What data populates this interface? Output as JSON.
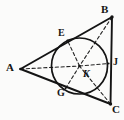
{
  "figure": {
    "kind": "geometry-diagram",
    "canvas": {
      "width": 124,
      "height": 120
    },
    "colors": {
      "background": "#fbfbfa",
      "stroke": "#141414",
      "dash": "#242424",
      "label": "#141414"
    },
    "stroke_widths": {
      "triangle": 1.9,
      "circle": 1.7,
      "dashed": 1.1
    },
    "points": [
      {
        "id": "A",
        "label": "A",
        "x": 20.5,
        "y": 69.0,
        "role": "triangle-vertex",
        "label_x": 6,
        "label_y": 62
      },
      {
        "id": "B",
        "label": "B",
        "x": 112.0,
        "y": 17.0,
        "role": "triangle-vertex",
        "label_x": 101,
        "label_y": 4
      },
      {
        "id": "C",
        "label": "C",
        "x": 110.5,
        "y": 104.0,
        "role": "triangle-vertex",
        "label_x": 112,
        "label_y": 104
      },
      {
        "id": "E",
        "label": "E",
        "x": 67.5,
        "y": 40.5,
        "role": "tangent-point",
        "label_x": 58,
        "label_y": 28
      },
      {
        "id": "G",
        "label": "G",
        "x": 65.5,
        "y": 88.5,
        "role": "tangent-point",
        "label_x": 57,
        "label_y": 88
      },
      {
        "id": "J",
        "label": "J",
        "x": 108.5,
        "y": 63.5,
        "role": "tangent-point",
        "label_x": 113,
        "label_y": 57
      },
      {
        "id": "K",
        "label": "K",
        "x": 79.5,
        "y": 66.0,
        "role": "incircle-center",
        "label_x": 83,
        "label_y": 69
      }
    ],
    "circle": {
      "id": "incircle",
      "cx": 79.5,
      "cy": 66.0,
      "r": 28.0
    },
    "solid_segments": [
      {
        "id": "side-AB",
        "from": "A",
        "to": "B"
      },
      {
        "id": "side-BC",
        "from": "B",
        "to": "C"
      },
      {
        "id": "side-CA",
        "from": "C",
        "to": "A"
      }
    ],
    "dashed_segments": [
      {
        "id": "bisector-AK",
        "from": "A",
        "to": "K"
      },
      {
        "id": "bisector-BK",
        "from": "B",
        "to": "K"
      },
      {
        "id": "bisector-CK",
        "from": "C",
        "to": "K"
      },
      {
        "id": "radius-KE",
        "from": "K",
        "to": "E"
      },
      {
        "id": "radius-KG",
        "from": "K",
        "to": "G"
      },
      {
        "id": "radius-KJ",
        "from": "K",
        "to": "J"
      }
    ]
  }
}
